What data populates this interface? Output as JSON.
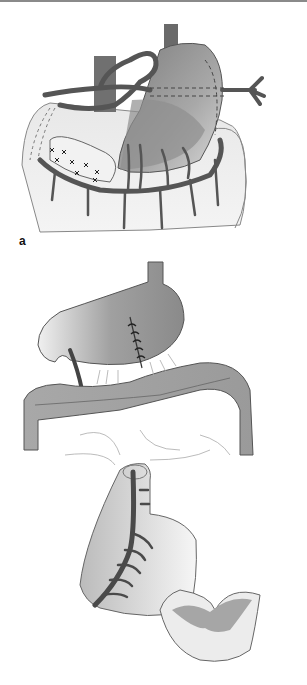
{
  "figure": {
    "panels": [
      {
        "id": "a",
        "label": "a",
        "description": "Stomach with surrounding vessels, omentum and colon; shaded resection zone and sutured segment"
      },
      {
        "id": "b",
        "label": "b",
        "description": "Stomach with sutured incision above transverse colon; pedicled gastric flap with vascular arcade below"
      }
    ]
  },
  "colors": {
    "vessel": "#5a5a5a",
    "stomach_dark": "#8c8c8c",
    "stomach_light": "#e6e6e6",
    "tissue_light": "#ececec",
    "outline": "#555555",
    "label": "#111111"
  }
}
